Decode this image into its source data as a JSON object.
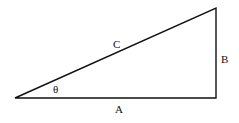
{
  "diagram": {
    "type": "right-triangle",
    "vertices": {
      "left": [
        15,
        98
      ],
      "bottom_right": [
        216,
        98
      ],
      "top_right": [
        216,
        8
      ]
    },
    "labels": {
      "hypotenuse": "C",
      "vertical_side": "B",
      "horizontal_side": "A",
      "angle": "θ"
    },
    "stroke_color": "#111111",
    "background": "#ffffff"
  }
}
